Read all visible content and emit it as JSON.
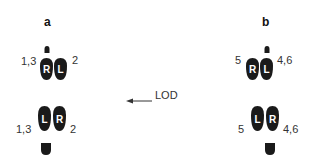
{
  "panels": [
    {
      "label": "a",
      "top": {
        "left_foot": "R",
        "right_foot": "L",
        "left_num": "1,3",
        "right_num": "2"
      },
      "bottom": {
        "left_foot": "L",
        "right_foot": "R",
        "left_num": "1,3",
        "right_num": "2"
      }
    },
    {
      "label": "b",
      "top": {
        "left_foot": "R",
        "right_foot": "L",
        "left_num": "5",
        "right_num": "4,6"
      },
      "bottom": {
        "left_foot": "L",
        "right_foot": "R",
        "left_num": "5",
        "right_num": "4,6"
      }
    }
  ],
  "direction": {
    "label": "LOD",
    "arrow": "left-arrow"
  },
  "colors": {
    "foot_fill": "#1a1a1a",
    "foot_letter": "#ffffff",
    "text": "#333333"
  }
}
